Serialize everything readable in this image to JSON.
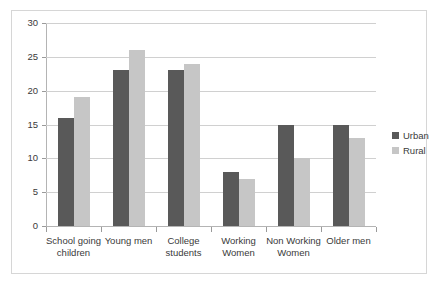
{
  "chart_data": {
    "type": "bar",
    "title": "",
    "xlabel": "",
    "ylabel": "",
    "ylim": [
      0,
      30
    ],
    "yticks": [
      0,
      5,
      10,
      15,
      20,
      25,
      30
    ],
    "grid": true,
    "legend_position": "right",
    "categories": [
      "School going children",
      "Young men",
      "College students",
      "Working Women",
      "Non Working Women",
      "Older men"
    ],
    "category_lines": [
      [
        "School going",
        "children"
      ],
      [
        "Young men",
        ""
      ],
      [
        "College",
        "students"
      ],
      [
        "Working",
        "Women"
      ],
      [
        "Non Working",
        "Women"
      ],
      [
        "Older men",
        ""
      ]
    ],
    "series": [
      {
        "name": "Urban",
        "color": "#595959",
        "values": [
          16,
          23,
          23,
          8,
          15,
          15
        ]
      },
      {
        "name": "Rural",
        "color": "#c6c6c6",
        "values": [
          19,
          26,
          24,
          7,
          10,
          13
        ]
      }
    ]
  },
  "legend": {
    "items": [
      {
        "label": "Urban",
        "swatch": "urban-legend-swatch"
      },
      {
        "label": "Rural",
        "swatch": "rural-legend-swatch"
      }
    ]
  },
  "colors": {
    "urban": "#595959",
    "rural": "#c6c6c6",
    "gridline": "#d0d0d0",
    "axis": "#b4b4b4",
    "frame_border": "#d6d6d6",
    "background": "#ffffff",
    "text": "#3a3a3a"
  }
}
